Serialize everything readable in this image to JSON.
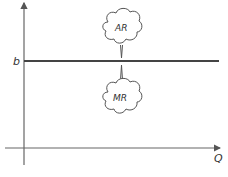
{
  "diagram": {
    "y_axis": {
      "label": "",
      "value_label": "b"
    },
    "x_axis": {
      "label": "Q"
    },
    "line": {
      "name": "price line",
      "level_label": "b",
      "color": "#444444"
    },
    "callouts": [
      {
        "label": "AR",
        "position": "above"
      },
      {
        "label": "MR",
        "position": "below"
      }
    ],
    "colors": {
      "axis": "#666666",
      "line": "#444444",
      "text": "#333333"
    }
  }
}
